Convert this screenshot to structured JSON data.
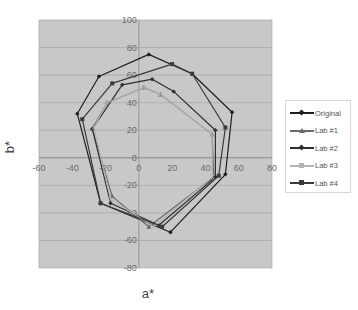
{
  "chart_data": {
    "type": "scatter",
    "subtype": "line-with-markers (closed polygons)",
    "title": "",
    "xlabel": "a*",
    "ylabel": "b*",
    "xlim": [
      -60,
      80
    ],
    "ylim": [
      -80,
      100
    ],
    "x_ticks": [
      -60,
      -40,
      -20,
      0,
      20,
      40,
      60,
      80
    ],
    "y_ticks": [
      -80,
      -60,
      -40,
      -20,
      0,
      20,
      40,
      60,
      80,
      100
    ],
    "grid": {
      "horizontal": true,
      "vertical": false
    },
    "legend_position": "right",
    "series": [
      {
        "name": "Original",
        "color": "#1e1e1e",
        "marker": "diamond",
        "points": [
          [
            6,
            75
          ],
          [
            32,
            61
          ],
          [
            56,
            33
          ],
          [
            52,
            -12
          ],
          [
            19,
            -54
          ],
          [
            -23,
            -33
          ],
          [
            -37,
            32
          ],
          [
            -24,
            59
          ],
          [
            6,
            75
          ]
        ]
      },
      {
        "name": "Lab #1",
        "color": "#6a6a6a",
        "marker": "triangle",
        "points": [
          [
            3,
            51
          ],
          [
            13,
            46
          ],
          [
            44,
            17
          ],
          [
            45,
            -14
          ],
          [
            6,
            -50
          ],
          [
            -16,
            -28
          ],
          [
            -28,
            21
          ],
          [
            -19,
            40
          ],
          [
            3,
            51
          ]
        ]
      },
      {
        "name": "Lab #2",
        "color": "#2e2e2e",
        "marker": "diamond",
        "points": [
          [
            8,
            57
          ],
          [
            21,
            48
          ],
          [
            46,
            20
          ],
          [
            46,
            -14
          ],
          [
            12,
            -49
          ],
          [
            -17,
            -33
          ],
          [
            -28,
            21
          ],
          [
            -10,
            53
          ],
          [
            8,
            57
          ]
        ]
      },
      {
        "name": "Lab #3",
        "color": "#b4b4b4",
        "marker": "x",
        "points": [
          [
            3,
            51
          ],
          [
            13,
            46
          ],
          [
            44,
            17
          ],
          [
            44,
            -14
          ],
          [
            9,
            -50
          ],
          [
            -17,
            -30
          ],
          [
            -27,
            22
          ],
          [
            -19,
            40
          ],
          [
            3,
            51
          ]
        ]
      },
      {
        "name": "Lab #4",
        "color": "#3a3a3a",
        "marker": "square",
        "points": [
          [
            20,
            68
          ],
          [
            32,
            61
          ],
          [
            52,
            22
          ],
          [
            48,
            -13
          ],
          [
            14,
            -50
          ],
          [
            -23,
            -33
          ],
          [
            -34,
            28
          ],
          [
            -16,
            54
          ],
          [
            20,
            68
          ]
        ]
      }
    ]
  },
  "legend": {
    "items": [
      {
        "label": "Original",
        "color": "#1e1e1e"
      },
      {
        "label": "Lab #1",
        "color": "#6a6a6a"
      },
      {
        "label": "Lab #2",
        "color": "#2e2e2e"
      },
      {
        "label": "Lab #3",
        "color": "#b4b4b4"
      },
      {
        "label": "Lab #4",
        "color": "#3a3a3a"
      }
    ]
  },
  "axes": {
    "x_title": "a*",
    "y_title": "b*"
  }
}
